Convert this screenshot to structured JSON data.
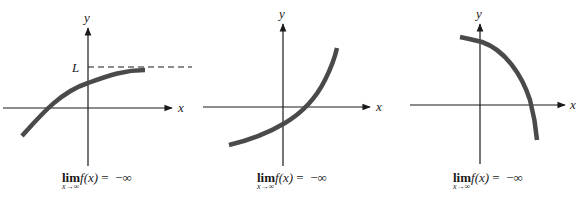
{
  "figure": {
    "panels": [
      {
        "id": "panel-1",
        "x_label": "x",
        "y_label": "y",
        "asymptote_label": "L",
        "caption": {
          "lim": "lim",
          "sub": "x→∞",
          "func": "f(x)",
          "eq": " =  −∞"
        },
        "description": "Increasing concave-down curve approaching horizontal asymptote y = L (dashed)"
      },
      {
        "id": "panel-2",
        "x_label": "x",
        "y_label": "y",
        "caption": {
          "lim": "lim",
          "sub": "x→∞",
          "func": "f(x)",
          "eq": " =  −∞"
        },
        "description": "Increasing concave-up curve growing without bound"
      },
      {
        "id": "panel-3",
        "x_label": "x",
        "y_label": "y",
        "caption": {
          "lim": "lim",
          "sub": "x→∞",
          "func": "f(x)",
          "eq": " =  −∞"
        },
        "description": "Decreasing concave-down curve falling steeply past the x-axis"
      }
    ],
    "colors": {
      "axis": "#1a1a1a",
      "curve": "#4a4a4a",
      "background": "#ffffff"
    }
  }
}
